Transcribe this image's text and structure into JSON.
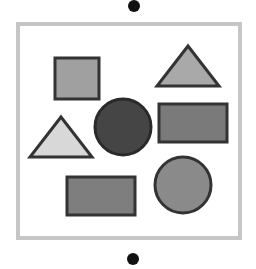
{
  "canvas": {
    "width": 256,
    "height": 269,
    "background": "#ffffff"
  },
  "dots": {
    "top": {
      "cx": 134,
      "cy": 6,
      "r": 6,
      "fill": "#111111"
    },
    "bottom": {
      "cx": 133,
      "cy": 259,
      "r": 6,
      "fill": "#111111"
    }
  },
  "frame": {
    "x": 18,
    "y": 24,
    "width": 222,
    "height": 214,
    "stroke": "#c6c6c6",
    "stroke_width": 4,
    "fill": "#ffffff"
  },
  "shapes": {
    "square": {
      "x": 55,
      "y": 58,
      "width": 44,
      "height": 41,
      "fill": "#a0a0a0",
      "stroke": "#333333"
    },
    "triangle_top_right": {
      "points": "188,46 157,86 219,86",
      "fill": "#a9a9a9",
      "stroke": "#333333"
    },
    "triangle_left": {
      "points": "61,117 30,157 92,157",
      "fill": "#d8d8d8",
      "stroke": "#333333"
    },
    "circle_dark": {
      "cx": 123,
      "cy": 127,
      "r": 28,
      "fill": "#454545",
      "stroke": "#2a2a2a"
    },
    "rect_right": {
      "x": 159,
      "y": 104,
      "width": 68,
      "height": 38,
      "fill": "#7a7a7a",
      "stroke": "#333333"
    },
    "rect_bottom": {
      "x": 67,
      "y": 177,
      "width": 68,
      "height": 38,
      "fill": "#7e7e7e",
      "stroke": "#333333"
    },
    "circle_right": {
      "cx": 183,
      "cy": 185,
      "r": 28,
      "fill": "#8a8a8a",
      "stroke": "#333333"
    }
  }
}
